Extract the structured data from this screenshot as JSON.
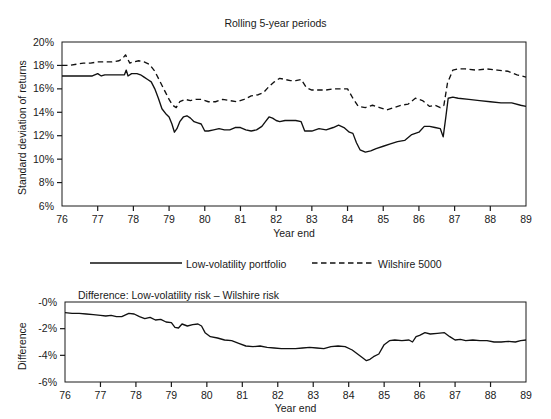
{
  "chart_data": [
    {
      "id": "rolling-std-dev",
      "type": "line",
      "title": "Rolling 5-year periods",
      "xlabel": "Year end",
      "ylabel": "Standard deviation of returns",
      "xlim": [
        76,
        89
      ],
      "ylim": [
        6,
        20
      ],
      "ytick_labels": [
        "20%",
        "18%",
        "16%",
        "14%",
        "12%",
        "10%",
        "8%",
        "6%"
      ],
      "ytick_values": [
        20,
        18,
        16,
        14,
        12,
        10,
        8,
        6
      ],
      "xtick_labels": [
        "76",
        "77",
        "78",
        "79",
        "80",
        "81",
        "82",
        "83",
        "84",
        "85",
        "86",
        "87",
        "88",
        "89"
      ],
      "xtick_values": [
        76,
        77,
        78,
        79,
        80,
        81,
        82,
        83,
        84,
        85,
        86,
        87,
        88,
        89
      ],
      "grid": false,
      "legend_position": "below-plot",
      "series": [
        {
          "name": "Low-volatility portfolio",
          "style": "solid",
          "color": "#111111",
          "x": [
            76.0,
            76.15,
            76.3,
            76.5,
            76.7,
            76.85,
            77.0,
            77.1,
            77.2,
            77.3,
            77.45,
            77.6,
            77.75,
            77.8,
            77.85,
            77.95,
            78.1,
            78.2,
            78.3,
            78.4,
            78.5,
            78.6,
            78.7,
            78.8,
            78.9,
            79.0,
            79.08,
            79.15,
            79.22,
            79.3,
            79.4,
            79.5,
            79.6,
            79.7,
            79.8,
            79.9,
            80.0,
            80.1,
            80.25,
            80.4,
            80.55,
            80.7,
            80.85,
            81.0,
            81.15,
            81.3,
            81.45,
            81.6,
            81.7,
            81.8,
            81.9,
            82.0,
            82.1,
            82.25,
            82.4,
            82.55,
            82.7,
            82.8,
            82.9,
            83.0,
            83.2,
            83.4,
            83.6,
            83.75,
            83.9,
            84.05,
            84.15,
            84.25,
            84.35,
            84.5,
            84.65,
            84.8,
            85.0,
            85.2,
            85.4,
            85.6,
            85.8,
            86.0,
            86.15,
            86.3,
            86.45,
            86.6,
            86.68,
            86.75,
            86.82,
            86.95,
            87.1,
            87.4,
            87.7,
            88.0,
            88.3,
            88.6,
            88.85,
            89.0
          ],
          "y": [
            17.1,
            17.1,
            17.1,
            17.1,
            17.1,
            17.1,
            17.3,
            17.1,
            17.2,
            17.2,
            17.2,
            17.2,
            17.2,
            17.6,
            17.1,
            17.3,
            17.3,
            17.2,
            17.0,
            16.8,
            16.6,
            16.0,
            15.2,
            14.3,
            13.9,
            13.6,
            13.0,
            12.3,
            12.6,
            13.2,
            13.6,
            13.7,
            13.5,
            13.2,
            13.1,
            13.0,
            12.4,
            12.4,
            12.5,
            12.6,
            12.5,
            12.5,
            12.7,
            12.7,
            12.5,
            12.4,
            12.5,
            12.8,
            13.2,
            13.6,
            13.5,
            13.3,
            13.2,
            13.3,
            13.3,
            13.3,
            13.2,
            12.4,
            12.4,
            12.4,
            12.6,
            12.5,
            12.7,
            12.9,
            12.7,
            12.3,
            12.2,
            11.4,
            10.8,
            10.6,
            10.7,
            10.9,
            11.1,
            11.3,
            11.5,
            11.6,
            12.1,
            12.3,
            12.8,
            12.8,
            12.7,
            12.6,
            11.9,
            13.5,
            15.2,
            15.3,
            15.2,
            15.1,
            15.0,
            14.9,
            14.8,
            14.8,
            14.6,
            14.5
          ]
        },
        {
          "name": "Wilshire 5000",
          "style": "dashed",
          "color": "#111111",
          "x": [
            76.0,
            76.2,
            76.4,
            76.6,
            76.8,
            77.0,
            77.2,
            77.4,
            77.6,
            77.7,
            77.78,
            77.9,
            78.0,
            78.15,
            78.3,
            78.45,
            78.6,
            78.75,
            78.9,
            79.0,
            79.1,
            79.2,
            79.3,
            79.45,
            79.6,
            79.75,
            79.9,
            80.1,
            80.3,
            80.5,
            80.7,
            80.9,
            81.1,
            81.3,
            81.5,
            81.65,
            81.8,
            81.95,
            82.1,
            82.25,
            82.4,
            82.55,
            82.7,
            82.85,
            83.0,
            83.2,
            83.4,
            83.6,
            83.8,
            84.0,
            84.15,
            84.3,
            84.5,
            84.7,
            84.9,
            85.1,
            85.3,
            85.5,
            85.7,
            85.9,
            86.1,
            86.3,
            86.45,
            86.6,
            86.7,
            86.8,
            86.95,
            87.1,
            87.3,
            87.6,
            87.9,
            88.2,
            88.5,
            88.75,
            89.0
          ],
          "y": [
            18.0,
            18.0,
            18.1,
            18.2,
            18.2,
            18.3,
            18.3,
            18.3,
            18.4,
            18.6,
            18.9,
            18.2,
            18.3,
            18.4,
            18.3,
            18.1,
            17.5,
            16.6,
            15.7,
            15.1,
            14.6,
            14.4,
            14.9,
            15.1,
            15.0,
            15.1,
            15.1,
            14.9,
            14.9,
            15.1,
            15.0,
            14.9,
            15.1,
            15.4,
            15.5,
            15.7,
            16.2,
            16.6,
            16.9,
            16.8,
            16.7,
            16.7,
            16.8,
            16.1,
            15.9,
            15.9,
            15.9,
            16.0,
            16.0,
            16.0,
            15.2,
            14.5,
            14.4,
            14.6,
            14.4,
            14.2,
            14.4,
            14.6,
            14.7,
            15.2,
            15.0,
            14.5,
            14.6,
            14.4,
            14.6,
            16.5,
            17.6,
            17.7,
            17.7,
            17.6,
            17.7,
            17.6,
            17.5,
            17.2,
            17.0
          ]
        }
      ]
    },
    {
      "id": "difference",
      "type": "line",
      "title": "Difference: Low-volatility risk – Wilshire risk",
      "xlabel": "Year end",
      "ylabel": "Difference",
      "xlim": [
        76,
        89
      ],
      "ylim": [
        -6,
        0
      ],
      "ytick_labels": [
        "-0%",
        "-2%",
        "-4%",
        "-6%"
      ],
      "ytick_values": [
        0,
        -2,
        -4,
        -6
      ],
      "xtick_labels": [
        "76",
        "77",
        "78",
        "79",
        "80",
        "81",
        "82",
        "83",
        "84",
        "85",
        "86",
        "87",
        "88",
        "89"
      ],
      "xtick_values": [
        76,
        77,
        78,
        79,
        80,
        81,
        82,
        83,
        84,
        85,
        86,
        87,
        88,
        89
      ],
      "grid": false,
      "series": [
        {
          "name": "Difference",
          "style": "solid",
          "color": "#111111",
          "x": [
            76.0,
            76.2,
            76.4,
            76.6,
            76.8,
            77.0,
            77.15,
            77.3,
            77.45,
            77.6,
            77.8,
            77.95,
            78.1,
            78.25,
            78.4,
            78.55,
            78.7,
            78.85,
            79.0,
            79.1,
            79.2,
            79.3,
            79.45,
            79.6,
            79.75,
            79.85,
            79.95,
            80.1,
            80.3,
            80.5,
            80.7,
            80.9,
            81.1,
            81.3,
            81.5,
            81.7,
            81.9,
            82.1,
            82.3,
            82.5,
            82.7,
            82.9,
            83.1,
            83.3,
            83.5,
            83.7,
            83.9,
            84.1,
            84.25,
            84.4,
            84.5,
            84.6,
            84.7,
            84.85,
            85.0,
            85.15,
            85.3,
            85.5,
            85.7,
            85.8,
            85.9,
            86.0,
            86.15,
            86.3,
            86.5,
            86.7,
            86.85,
            87.0,
            87.15,
            87.3,
            87.5,
            87.7,
            87.9,
            88.1,
            88.3,
            88.5,
            88.7,
            88.85,
            89.0
          ],
          "y": [
            -0.8,
            -0.85,
            -0.85,
            -0.9,
            -0.95,
            -1.0,
            -1.05,
            -1.0,
            -1.1,
            -1.1,
            -0.85,
            -0.9,
            -1.1,
            -1.25,
            -1.15,
            -1.35,
            -1.3,
            -1.5,
            -1.55,
            -1.9,
            -1.95,
            -1.65,
            -1.8,
            -1.7,
            -1.65,
            -1.8,
            -2.3,
            -2.6,
            -2.7,
            -2.85,
            -2.9,
            -3.1,
            -3.3,
            -3.35,
            -3.3,
            -3.4,
            -3.45,
            -3.5,
            -3.5,
            -3.5,
            -3.45,
            -3.4,
            -3.45,
            -3.5,
            -3.35,
            -3.3,
            -3.35,
            -3.6,
            -3.9,
            -4.2,
            -4.4,
            -4.3,
            -4.1,
            -3.9,
            -3.2,
            -2.9,
            -2.85,
            -2.9,
            -2.85,
            -3.0,
            -2.6,
            -2.5,
            -2.3,
            -2.4,
            -2.35,
            -2.3,
            -2.6,
            -2.85,
            -2.8,
            -2.9,
            -2.85,
            -2.9,
            -2.9,
            -3.0,
            -3.0,
            -2.95,
            -3.0,
            -2.9,
            -2.85
          ]
        }
      ]
    }
  ],
  "legend": {
    "items": [
      {
        "label": "Low-volatility portfolio",
        "style": "solid"
      },
      {
        "label": "Wilshire 5000",
        "style": "dashed"
      }
    ]
  },
  "colors": {
    "line": "#111111",
    "axis": "#1a1a1a",
    "background": "#ffffff"
  }
}
